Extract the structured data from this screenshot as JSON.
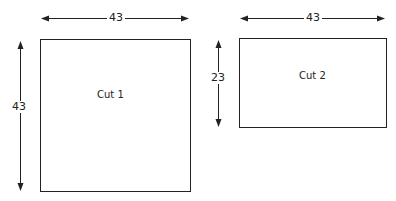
{
  "diagram": {
    "cuts": [
      {
        "label": "Cut 1",
        "width_label": "43",
        "height_label": "43"
      },
      {
        "label": "Cut 2",
        "width_label": "43",
        "height_label": "23"
      }
    ],
    "colors": {
      "line": "#222222",
      "background": "#ffffff"
    }
  }
}
